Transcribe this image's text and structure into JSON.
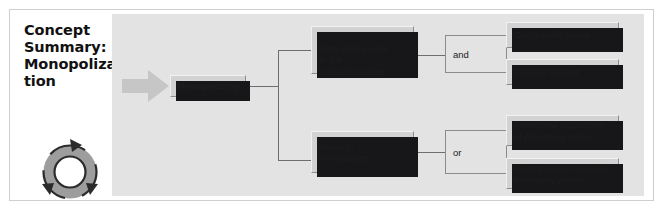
{
  "document": {
    "title_lines": "Concept\nSummary:\nMonopoliza-\ntion",
    "icon": "cycle-arrows-icon"
  },
  "diagram": {
    "type": "tree",
    "entry_arrow": "right-block-arrow",
    "root": {
      "id": "monopolizing",
      "label": "Monopolizing"
    },
    "branches": [
      {
        "id": "monopoly-power",
        "label": "Monopoly power\nin the\nrelevant market",
        "connector": "and",
        "children": [
          {
            "id": "geographic-scope",
            "label": "Geographic scope"
          },
          {
            "id": "product-market",
            "label": "Product market"
          }
        ]
      },
      {
        "id": "intent-to-monopolize",
        "label": "Intent to\nmonopolize",
        "connector": "or",
        "children": [
          {
            "id": "intentional-acquisition",
            "label": "Intentional acquisition\nof monopoly power"
          },
          {
            "id": "attempting-to-maintain",
            "label": "Attempting to maintain\nmonopoly power"
          }
        ]
      }
    ],
    "colors": {
      "panel_background": "#e3e3e3",
      "node_fill": "#d2d2d2",
      "node_border": "#8d8d8d",
      "shadow": "#17171a",
      "connector_line": "#6e6e6e",
      "arrow_fill": "#c6c6c6",
      "title_text": "#111111",
      "page_background": "#ffffff"
    }
  }
}
